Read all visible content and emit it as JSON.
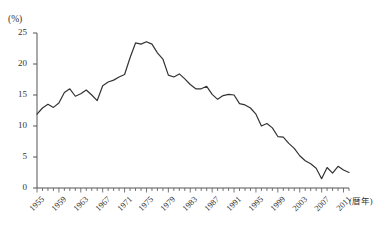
{
  "chart_data": {
    "type": "line",
    "title": "",
    "subtitle": "",
    "xlabel": "(暦年)",
    "ylabel": "(%)",
    "ylim": [
      0,
      25
    ],
    "xlim": [
      1955,
      2012
    ],
    "yticks": [
      0,
      5,
      10,
      15,
      20,
      25
    ],
    "ytick_labels": [
      "0",
      "5",
      "10",
      "15",
      "20",
      "25"
    ],
    "xticks": [
      1955,
      1959,
      1963,
      1967,
      1971,
      1975,
      1979,
      1983,
      1987,
      1991,
      1995,
      1999,
      2003,
      2007,
      2011
    ],
    "xtick_labels": [
      "1955",
      "1959",
      "1963",
      "1967",
      "1971",
      "1975",
      "1979",
      "1983",
      "1987",
      "1991",
      "1995",
      "1999",
      "2003",
      "2007",
      "2011"
    ],
    "minor_tick_interval": 1,
    "grid": false,
    "legend": false,
    "legend_position": "none",
    "line_color": "#333333",
    "line_width": 1.2,
    "x": [
      1955,
      1956,
      1957,
      1958,
      1959,
      1960,
      1961,
      1962,
      1963,
      1964,
      1965,
      1966,
      1967,
      1968,
      1969,
      1970,
      1971,
      1972,
      1973,
      1974,
      1975,
      1976,
      1977,
      1978,
      1979,
      1980,
      1981,
      1982,
      1983,
      1984,
      1985,
      1986,
      1987,
      1988,
      1989,
      1990,
      1991,
      1992,
      1993,
      1994,
      1995,
      1996,
      1997,
      1998,
      1999,
      2000,
      2001,
      2002,
      2003,
      2004,
      2005,
      2006,
      2007,
      2008,
      2009,
      2010,
      2011,
      2012
    ],
    "values": [
      11.9,
      12.9,
      13.5,
      13.0,
      13.7,
      15.4,
      16.0,
      14.8,
      15.2,
      15.8,
      15.0,
      14.1,
      16.5,
      17.1,
      17.4,
      17.9,
      18.3,
      21.0,
      23.4,
      23.2,
      23.6,
      23.2,
      21.8,
      20.8,
      18.2,
      17.9,
      18.4,
      17.6,
      16.7,
      16.0,
      16.0,
      16.4,
      15.1,
      14.3,
      14.9,
      15.1,
      15.0,
      13.6,
      13.4,
      12.9,
      11.9,
      10.0,
      10.4,
      9.7,
      8.3,
      8.2,
      7.2,
      6.4,
      5.2,
      4.4,
      3.9,
      3.2,
      1.5,
      3.3,
      2.4,
      3.5,
      2.9,
      2.5
    ],
    "annotations": []
  }
}
